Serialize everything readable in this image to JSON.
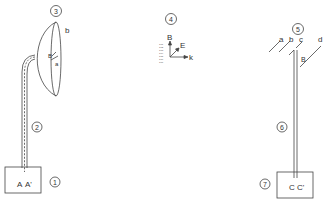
{
  "diagram": {
    "callouts": {
      "n1": "1",
      "n2": "2",
      "n3": "3",
      "n4": "4",
      "n5": "5",
      "n6": "6",
      "n7": "7"
    },
    "left_assembly": {
      "box_labels": {
        "a": "A",
        "a_prime": "A'"
      },
      "dish_labels": {
        "b": "b",
        "a": "a",
        "feed": "B"
      }
    },
    "middle_axes": {
      "b_label": "B",
      "e_label": "E",
      "k_label": "k",
      "legend_lines": [
        "101",
        "102",
        "103",
        "104",
        "105",
        "106",
        "107"
      ]
    },
    "right_assembly": {
      "element_labels": {
        "a": "a",
        "b": "b",
        "c": "c",
        "d": "d"
      },
      "feed_label": "B",
      "box_labels": {
        "c": "C",
        "c_prime": "C'"
      }
    }
  }
}
